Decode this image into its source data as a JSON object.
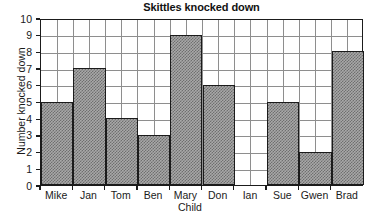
{
  "chart_data": {
    "type": "bar",
    "title": "Skittles knocked down",
    "xlabel": "Child",
    "ylabel": "Number knocked down",
    "categories": [
      "Mike",
      "Jan",
      "Tom",
      "Ben",
      "Mary",
      "Don",
      "Ian",
      "Sue",
      "Gwen",
      "Brad"
    ],
    "values": [
      5,
      7,
      4,
      3,
      9,
      6,
      0,
      5,
      2,
      8
    ],
    "ylim": [
      0,
      10
    ],
    "ytick_labels": [
      "0",
      "1",
      "2",
      "3",
      "4",
      "5",
      "6",
      "7",
      "8",
      "9",
      "10"
    ],
    "ytick_step": 1,
    "grid": true,
    "grid_vertical_per_bar": 2,
    "legend": null,
    "bar_fill_color": "#a8a8a8",
    "bar_edge_color": "#1b1b1b",
    "grid_color": "#8e8e8e",
    "axis_color": "#1b1b1b",
    "background_color": "#ffffff"
  }
}
